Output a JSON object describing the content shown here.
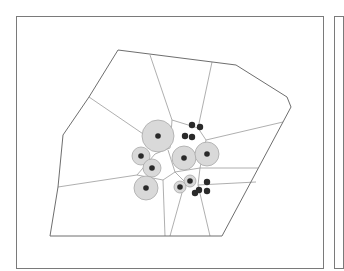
{
  "diagram": {
    "type": "voronoi-tessellation-with-weighted-sites",
    "colors": {
      "frame": "#7a7a7a",
      "hull": "#6e6e6e",
      "edges": "#9a9a9a",
      "halo_fill": "#d9d9d9",
      "halo_stroke": "#a8a8a8",
      "site": "#2a2a2a",
      "background": "#ffffff"
    },
    "hull": [
      [
        118,
        50
      ],
      [
        236,
        65
      ],
      [
        287,
        97
      ],
      [
        291,
        107
      ],
      [
        283,
        122
      ],
      [
        222,
        236
      ],
      [
        50,
        236
      ],
      [
        58,
        187
      ],
      [
        63,
        135
      ],
      [
        89,
        97
      ]
    ],
    "edges": [
      [
        [
          150,
          55
        ],
        [
          172,
          120
        ]
      ],
      [
        [
          212,
          62
        ],
        [
          198,
          128
        ]
      ],
      [
        [
          89,
          97
        ],
        [
          152,
          140
        ]
      ],
      [
        [
          172,
          120
        ],
        [
          198,
          128
        ]
      ],
      [
        [
          172,
          120
        ],
        [
          170,
          148
        ]
      ],
      [
        [
          198,
          128
        ],
        [
          206,
          140
        ]
      ],
      [
        [
          206,
          140
        ],
        [
          283,
          122
        ]
      ],
      [
        [
          170,
          148
        ],
        [
          155,
          154
        ]
      ],
      [
        [
          155,
          154
        ],
        [
          137,
          175
        ]
      ],
      [
        [
          137,
          175
        ],
        [
          58,
          187
        ]
      ],
      [
        [
          137,
          175
        ],
        [
          163,
          180
        ]
      ],
      [
        [
          163,
          180
        ],
        [
          175,
          172
        ]
      ],
      [
        [
          175,
          172
        ],
        [
          168,
          150
        ]
      ],
      [
        [
          163,
          180
        ],
        [
          165,
          236
        ]
      ],
      [
        [
          175,
          172
        ],
        [
          200,
          168
        ]
      ],
      [
        [
          200,
          168
        ],
        [
          258,
          168
        ]
      ],
      [
        [
          200,
          168
        ],
        [
          206,
          140
        ]
      ],
      [
        [
          175,
          172
        ],
        [
          185,
          182
        ]
      ],
      [
        [
          185,
          182
        ],
        [
          170,
          236
        ]
      ],
      [
        [
          200,
          168
        ],
        [
          198,
          185
        ]
      ],
      [
        [
          198,
          185
        ],
        [
          210,
          236
        ]
      ],
      [
        [
          198,
          185
        ],
        [
          256,
          182
        ]
      ]
    ],
    "sites": [
      {
        "x": 158,
        "y": 136,
        "r": 16,
        "halo": true
      },
      {
        "x": 141,
        "y": 156,
        "r": 9,
        "halo": true
      },
      {
        "x": 152,
        "y": 168,
        "r": 9,
        "halo": true
      },
      {
        "x": 146,
        "y": 188,
        "r": 12,
        "halo": true
      },
      {
        "x": 184,
        "y": 158,
        "r": 12,
        "halo": true
      },
      {
        "x": 207,
        "y": 154,
        "r": 12,
        "halo": true
      },
      {
        "x": 190,
        "y": 181,
        "r": 6,
        "halo": true
      },
      {
        "x": 180,
        "y": 187,
        "r": 6,
        "halo": true
      },
      {
        "x": 192,
        "y": 125,
        "r": 0,
        "halo": false
      },
      {
        "x": 200,
        "y": 127,
        "r": 0,
        "halo": false
      },
      {
        "x": 185,
        "y": 136,
        "r": 0,
        "halo": false
      },
      {
        "x": 192,
        "y": 137,
        "r": 0,
        "halo": false
      },
      {
        "x": 207,
        "y": 182,
        "r": 0,
        "halo": false
      },
      {
        "x": 207,
        "y": 191,
        "r": 0,
        "halo": false
      },
      {
        "x": 195,
        "y": 193,
        "r": 0,
        "halo": false
      },
      {
        "x": 199,
        "y": 190,
        "r": 0,
        "halo": false
      }
    ]
  }
}
